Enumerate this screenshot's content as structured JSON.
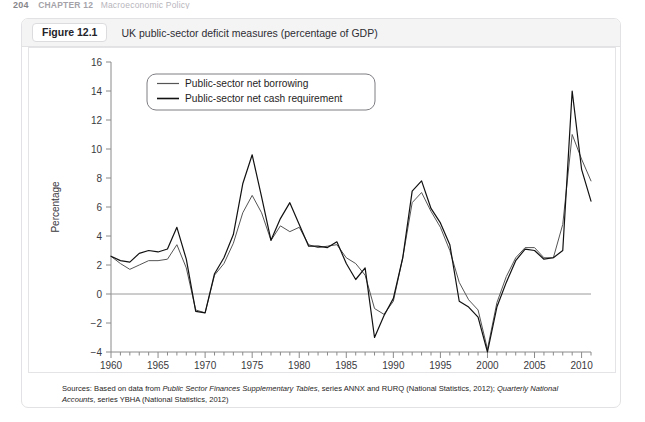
{
  "page_header": {
    "folio": "204",
    "chapter": "CHAPTER 12",
    "chapter_title": "Macroeconomic Policy"
  },
  "figure": {
    "tag": "Figure 12.1",
    "title": "UK public-sector deficit measures (percentage of GDP)",
    "source_prefix": "Sources: Based on data from ",
    "source_italic_1": "Public Sector Finances Supplementary Tables",
    "source_mid_1": ", series ANNX and RURQ (National Statistics, 2012); ",
    "source_italic_2": "Quarterly National Accounts",
    "source_mid_2": ", series YBHA (National Statistics, 2012)"
  },
  "colors": {
    "series_1": "#555555",
    "series_2": "#111111",
    "axis": "#8a8a8a",
    "zero_line": "#9a9a9a",
    "card_border": "#e2e2e4",
    "caption_bg": "#f4f4f5",
    "text": "#2e2d33"
  },
  "chart_data": {
    "type": "line",
    "title": "UK public-sector deficit measures (percentage of GDP)",
    "xlabel": "",
    "ylabel": "Percentage",
    "xlim": [
      1960,
      2011
    ],
    "ylim": [
      -4,
      16
    ],
    "ytick_step": 2,
    "yticks": [
      -4,
      -2,
      0,
      2,
      4,
      6,
      8,
      10,
      12,
      14,
      16
    ],
    "xticks": [
      1960,
      1965,
      1970,
      1975,
      1980,
      1985,
      1990,
      1995,
      2000,
      2005,
      2010
    ],
    "xtick_minor_step": 1,
    "grid": false,
    "legend_position": "top-left-inside",
    "zero_line": true,
    "x": [
      1960,
      1961,
      1962,
      1963,
      1964,
      1965,
      1966,
      1967,
      1968,
      1969,
      1970,
      1971,
      1972,
      1973,
      1974,
      1975,
      1976,
      1977,
      1978,
      1979,
      1980,
      1981,
      1982,
      1983,
      1984,
      1985,
      1986,
      1987,
      1988,
      1989,
      1990,
      1991,
      1992,
      1993,
      1994,
      1995,
      1996,
      1997,
      1998,
      1999,
      2000,
      2001,
      2002,
      2003,
      2004,
      2005,
      2006,
      2007,
      2008,
      2009,
      2010,
      2011
    ],
    "series": [
      {
        "name": "Public-sector net borrowing",
        "color": "#555555",
        "values": [
          2.6,
          2.1,
          1.7,
          2.0,
          2.3,
          2.3,
          2.4,
          3.4,
          1.8,
          -1.1,
          -1.3,
          1.3,
          2.1,
          3.5,
          5.6,
          6.8,
          5.6,
          3.7,
          4.7,
          4.3,
          4.6,
          3.4,
          3.2,
          3.3,
          3.4,
          2.5,
          2.1,
          1.3,
          -1.0,
          -1.4,
          -0.5,
          2.5,
          6.3,
          7.0,
          5.7,
          4.6,
          3.0,
          0.8,
          -0.4,
          -1.1,
          -3.8,
          -0.6,
          1.2,
          2.5,
          3.2,
          3.2,
          2.5,
          2.5,
          4.8,
          11.0,
          9.3,
          7.8
        ]
      },
      {
        "name": "Public-sector net cash requirement",
        "color": "#111111",
        "values": [
          2.6,
          2.3,
          2.2,
          2.8,
          3.0,
          2.9,
          3.1,
          4.6,
          2.4,
          -1.2,
          -1.3,
          1.4,
          2.5,
          4.1,
          7.6,
          9.6,
          6.7,
          3.7,
          5.2,
          6.3,
          4.8,
          3.3,
          3.3,
          3.2,
          3.6,
          2.1,
          1.0,
          1.8,
          -3.0,
          -1.5,
          -0.3,
          2.5,
          7.1,
          7.8,
          5.9,
          4.9,
          3.4,
          -0.5,
          -0.9,
          -1.6,
          -4.0,
          -0.9,
          0.8,
          2.3,
          3.1,
          3.0,
          2.4,
          2.5,
          3.0,
          14.0,
          8.6,
          6.4
        ]
      }
    ],
    "legend": [
      "Public-sector net borrowing",
      "Public-sector net cash requirement"
    ]
  }
}
